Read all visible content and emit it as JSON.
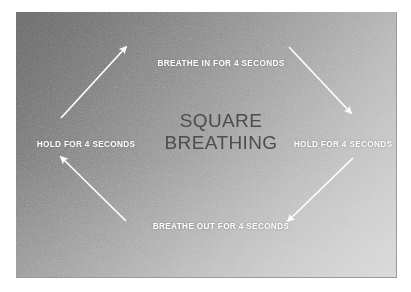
{
  "panel": {
    "background_top_left_color": "#686868",
    "background_bottom_right_color": "#d2d2d2"
  },
  "title": {
    "line1": "SQUARE",
    "line2": "BREATHING",
    "color": "#4d4d4d"
  },
  "labels": {
    "top": "BREATHE IN FOR 4 SECONDS",
    "right": "HOLD FOR 4 SECONDS",
    "bottom": "BREATHE OUT FOR 4 SECONDS",
    "left": "HOLD FOR 4 SECONDS",
    "color": "#ffffff"
  },
  "arrows": {
    "color": "#ffffff",
    "count": 4,
    "items": [
      {
        "name": "arrow-bottom-left-to-top",
        "direction": "up-right",
        "from": "HOLD FOR 4 SECONDS (left)",
        "to": "BREATHE IN FOR 4 SECONDS"
      },
      {
        "name": "arrow-top-to-bottom-right",
        "direction": "down-right",
        "from": "BREATHE IN FOR 4 SECONDS",
        "to": "HOLD FOR 4 SECONDS (right)"
      },
      {
        "name": "arrow-bottom-right-to-bottom",
        "direction": "down-left",
        "from": "HOLD FOR 4 SECONDS (right)",
        "to": "BREATHE OUT FOR 4 SECONDS"
      },
      {
        "name": "arrow-bottom-to-left",
        "direction": "up-left",
        "from": "BREATHE OUT FOR 4 SECONDS",
        "to": "HOLD FOR 4 SECONDS (left)"
      }
    ]
  }
}
